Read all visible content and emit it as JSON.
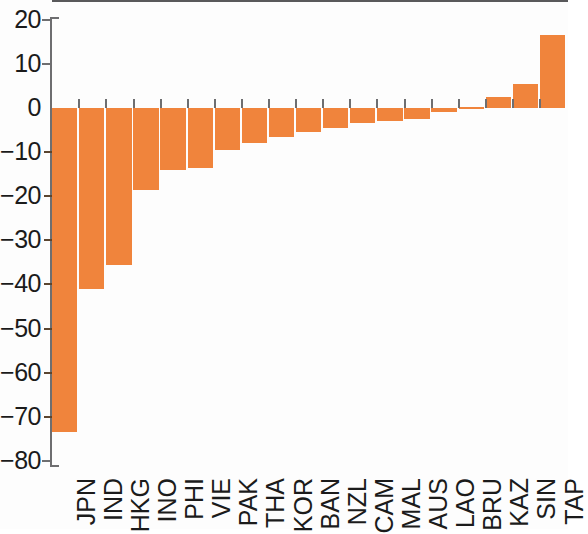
{
  "chart_data": {
    "type": "bar",
    "title": "",
    "subtitle": "",
    "xlabel": "",
    "ylabel": "",
    "ylim": [
      -80,
      20
    ],
    "grid": false,
    "legend": null,
    "bar_color": "#f0843c",
    "axis_color": "#59595b",
    "y_ticks": [
      20,
      10,
      0,
      -10,
      -20,
      -30,
      -40,
      -50,
      -60,
      -70,
      -80
    ],
    "y_tick_labels": [
      "20",
      "10",
      "0",
      "−10",
      "−20",
      "−30",
      "−40",
      "−50",
      "−60",
      "−70",
      "−80"
    ],
    "categories": [
      "JPN",
      "IND",
      "HKG",
      "INO",
      "PHI",
      "VIE",
      "PAK",
      "THA",
      "KOR",
      "BAN",
      "NZL",
      "CAM",
      "MAL",
      "AUS",
      "LAO",
      "BRU",
      "KAZ",
      "SIN",
      "TAP"
    ],
    "values": [
      -73.5,
      -41.0,
      -35.5,
      -18.5,
      -14.0,
      -13.5,
      -9.5,
      -8.0,
      -6.5,
      -5.5,
      -4.5,
      -3.5,
      -3.0,
      -2.5,
      -0.8,
      0.2,
      2.5,
      5.5,
      16.5
    ]
  }
}
